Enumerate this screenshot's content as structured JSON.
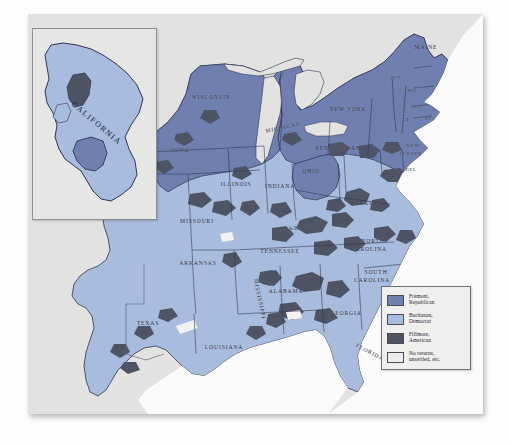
{
  "map": {
    "title": "United States presidential election of 1856 — results by county",
    "inset_label": "CALIFORNIA",
    "colors": {
      "fremont_republican": "#6f7fb0",
      "buchanan_democrat": "#a8bcdd",
      "fillmore_american": "#4e5463",
      "no_returns": "#ececeb",
      "water": "#ffffff",
      "plate_background": "#e2e2e0",
      "border": "#2f3550"
    },
    "legend": {
      "entries": [
        {
          "swatch": "#6f7fb0",
          "line1": "Frémont,",
          "line2": "Republican"
        },
        {
          "swatch": "#a8bcdd",
          "line1": "Buchanan,",
          "line2": "Democrat"
        },
        {
          "swatch": "#4e5463",
          "line1": "Fillmore,",
          "line2": "American"
        },
        {
          "swatch": "#ececeb",
          "line1": "No returns,",
          "line2": "unsettled, etc."
        }
      ]
    },
    "state_labels": [
      {
        "name": "MAINE",
        "x": 398,
        "y": 33,
        "size": "mid",
        "rot": 0,
        "style": ""
      },
      {
        "name": "VT",
        "x": 369,
        "y": 63,
        "size": "sml",
        "rot": 0,
        "style": ""
      },
      {
        "name": "NH",
        "x": 384,
        "y": 76,
        "size": "sml",
        "rot": 0,
        "style": ""
      },
      {
        "name": "MA",
        "x": 388,
        "y": 92,
        "size": "sml",
        "rot": 0,
        "style": ""
      },
      {
        "name": "CT",
        "x": 378,
        "y": 105,
        "size": "tiny",
        "rot": 0,
        "style": ""
      },
      {
        "name": "RI",
        "x": 400,
        "y": 104,
        "size": "tiny",
        "rot": 0,
        "style": ""
      },
      {
        "name": "NEW YORK",
        "x": 320,
        "y": 95,
        "size": "mid",
        "rot": 0,
        "style": ""
      },
      {
        "name": "PENNSYLVANIA",
        "x": 314,
        "y": 134,
        "size": "mid",
        "rot": 0,
        "style": ""
      },
      {
        "name": "NEW",
        "x": 385,
        "y": 131,
        "size": "sml",
        "rot": 0,
        "style": ""
      },
      {
        "name": "JERSEY",
        "x": 383,
        "y": 139,
        "size": "sml",
        "rot": 0,
        "style": ""
      },
      {
        "name": "MD",
        "x": 366,
        "y": 163,
        "size": "tiny",
        "rot": 0,
        "style": ""
      },
      {
        "name": "DEL",
        "x": 383,
        "y": 155,
        "size": "tiny",
        "rot": 0,
        "style": ""
      },
      {
        "name": "OHIO",
        "x": 283,
        "y": 157,
        "size": "mid",
        "rot": 0,
        "style": ""
      },
      {
        "name": "MICHIGAN",
        "x": 255,
        "y": 113,
        "size": "mid",
        "rot": -12,
        "style": ""
      },
      {
        "name": "WISCONSIN",
        "x": 183,
        "y": 83,
        "size": "mid",
        "rot": 0,
        "style": ""
      },
      {
        "name": "IOWA",
        "x": 152,
        "y": 136,
        "size": "mid",
        "rot": 0,
        "style": ""
      },
      {
        "name": "ILLINOIS",
        "x": 208,
        "y": 170,
        "size": "mid",
        "rot": 0,
        "style": ""
      },
      {
        "name": "INDIANA",
        "x": 252,
        "y": 172,
        "size": "mid",
        "rot": 0,
        "style": ""
      },
      {
        "name": "KENTUCKY",
        "x": 280,
        "y": 212,
        "size": "mid",
        "rot": -8,
        "style": ""
      },
      {
        "name": "MISSOURI",
        "x": 169,
        "y": 207,
        "size": "mid",
        "rot": 0,
        "style": ""
      },
      {
        "name": "VIRGINIA",
        "x": 340,
        "y": 189,
        "size": "mid",
        "rot": 0,
        "style": ""
      },
      {
        "name": "NORTH",
        "x": 345,
        "y": 227,
        "size": "mid",
        "rot": 0,
        "style": ""
      },
      {
        "name": "CAROLINA",
        "x": 341,
        "y": 235,
        "size": "mid",
        "rot": 0,
        "style": ""
      },
      {
        "name": "SOUTH",
        "x": 348,
        "y": 258,
        "size": "mid",
        "rot": 0,
        "style": ""
      },
      {
        "name": "CAROLINA",
        "x": 344,
        "y": 266,
        "size": "mid",
        "rot": 0,
        "style": ""
      },
      {
        "name": "TENNESSEE",
        "x": 252,
        "y": 237,
        "size": "mid",
        "rot": 0,
        "style": ""
      },
      {
        "name": "ARKANSAS",
        "x": 170,
        "y": 249,
        "size": "mid",
        "rot": 0,
        "style": ""
      },
      {
        "name": "ALABAMA",
        "x": 258,
        "y": 277,
        "size": "mid",
        "rot": 0,
        "style": ""
      },
      {
        "name": "GEORGIA",
        "x": 318,
        "y": 299,
        "size": "mid",
        "rot": 0,
        "style": ""
      },
      {
        "name": "MISSISSIPPI",
        "x": 232,
        "y": 285,
        "size": "mid",
        "rot": 78,
        "style": ""
      },
      {
        "name": "LOUISIANA",
        "x": 196,
        "y": 333,
        "size": "mid",
        "rot": 0,
        "style": ""
      },
      {
        "name": "TEXAS",
        "x": 120,
        "y": 309,
        "size": "mid",
        "rot": 0,
        "style": ""
      },
      {
        "name": "FLORIDA",
        "x": 342,
        "y": 338,
        "size": "mid",
        "rot": 28,
        "style": ""
      }
    ]
  }
}
